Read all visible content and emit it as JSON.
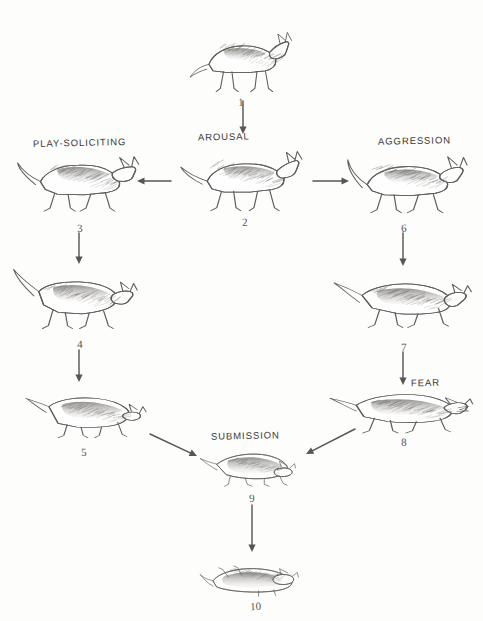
{
  "diagram": {
    "medium": "pencil-sketch line drawing",
    "background_color": "#fdfdfc",
    "ink_color": "#4a4844",
    "state_labels": [
      {
        "id": "arousal",
        "text": "AROUSAL",
        "x": 198,
        "y": 131
      },
      {
        "id": "play-soliciting",
        "text": "PLAY-SOLICITING",
        "x": 33,
        "y": 137
      },
      {
        "id": "aggression",
        "text": "AGGRESSION",
        "x": 378,
        "y": 135
      },
      {
        "id": "fear",
        "text": "FEAR",
        "x": 411,
        "y": 377
      },
      {
        "id": "submission",
        "text": "SUBMISSION",
        "x": 211,
        "y": 430
      }
    ],
    "figures": [
      {
        "number": "1",
        "pose": "alert-standing-neutral",
        "label_x": 238,
        "label_y": 96,
        "dog_x": 188,
        "dog_y": 18,
        "dog_w": 115,
        "dog_h": 80
      },
      {
        "number": "2",
        "pose": "aroused-standing-tail-raised",
        "label_x": 242,
        "label_y": 216,
        "dog_x": 176,
        "dog_y": 139,
        "dog_w": 132,
        "dog_h": 78
      },
      {
        "number": "3",
        "pose": "play-bow-approach",
        "label_x": 77,
        "label_y": 222,
        "dog_x": 14,
        "dog_y": 141,
        "dog_w": 132,
        "dog_h": 78
      },
      {
        "number": "4",
        "pose": "play-bow-front-lowered",
        "label_x": 77,
        "label_y": 338,
        "dog_x": 10,
        "dog_y": 262,
        "dog_w": 132,
        "dog_h": 74
      },
      {
        "number": "5",
        "pose": "crouched-play-bow-low",
        "label_x": 81,
        "label_y": 446,
        "dog_x": 26,
        "dog_y": 385,
        "dog_w": 126,
        "dog_h": 60
      },
      {
        "number": "6",
        "pose": "offensive-threat-stiff",
        "label_x": 401,
        "label_y": 222,
        "dog_x": 338,
        "dog_y": 141,
        "dog_w": 134,
        "dog_h": 78
      },
      {
        "number": "7",
        "pose": "offensive-threat-lunging",
        "label_x": 401,
        "label_y": 341,
        "dog_x": 334,
        "dog_y": 266,
        "dog_w": 140,
        "dog_h": 70
      },
      {
        "number": "8",
        "pose": "defensive-fear-snarl-crouch",
        "label_x": 401,
        "label_y": 436,
        "dog_x": 330,
        "dog_y": 382,
        "dog_w": 144,
        "dog_h": 58
      },
      {
        "number": "9",
        "pose": "active-submission-crouch",
        "label_x": 249,
        "label_y": 492,
        "dog_x": 200,
        "dog_y": 444,
        "dog_w": 104,
        "dog_h": 48
      },
      {
        "number": "10",
        "pose": "passive-submission-rollover",
        "label_x": 250,
        "label_y": 600,
        "dog_x": 200,
        "dog_y": 554,
        "dog_w": 104,
        "dog_h": 46
      }
    ],
    "arrows": [
      {
        "id": "arrow-1-to-2",
        "from": "1",
        "to": "2",
        "direction": "down",
        "x1": 243,
        "y1": 101,
        "x2": 243,
        "y2": 134
      },
      {
        "id": "arrow-2-to-3",
        "from": "2",
        "to": "3",
        "direction": "left",
        "x1": 171,
        "y1": 181,
        "x2": 137,
        "y2": 181
      },
      {
        "id": "arrow-2-to-6",
        "from": "2",
        "to": "6",
        "direction": "right",
        "x1": 313,
        "y1": 181,
        "x2": 349,
        "y2": 181
      },
      {
        "id": "arrow-3-to-4",
        "from": "3",
        "to": "4",
        "direction": "down",
        "x1": 79,
        "y1": 233,
        "x2": 79,
        "y2": 264
      },
      {
        "id": "arrow-4-to-5",
        "from": "4",
        "to": "5",
        "direction": "down",
        "x1": 79,
        "y1": 350,
        "x2": 79,
        "y2": 382
      },
      {
        "id": "arrow-6-to-7",
        "from": "6",
        "to": "7",
        "direction": "down",
        "x1": 403,
        "y1": 233,
        "x2": 403,
        "y2": 266
      },
      {
        "id": "arrow-7-to-8",
        "from": "7",
        "to": "8",
        "direction": "down",
        "x1": 403,
        "y1": 352,
        "x2": 403,
        "y2": 385
      },
      {
        "id": "arrow-5-to-9",
        "from": "5",
        "to": "9",
        "direction": "down-right",
        "x1": 150,
        "y1": 434,
        "x2": 197,
        "y2": 456
      },
      {
        "id": "arrow-8-to-9",
        "from": "8",
        "to": "9",
        "direction": "down-left",
        "x1": 355,
        "y1": 429,
        "x2": 306,
        "y2": 454
      },
      {
        "id": "arrow-9-to-10",
        "from": "9",
        "to": "10",
        "direction": "down",
        "x1": 252,
        "y1": 505,
        "x2": 252,
        "y2": 552
      }
    ]
  }
}
